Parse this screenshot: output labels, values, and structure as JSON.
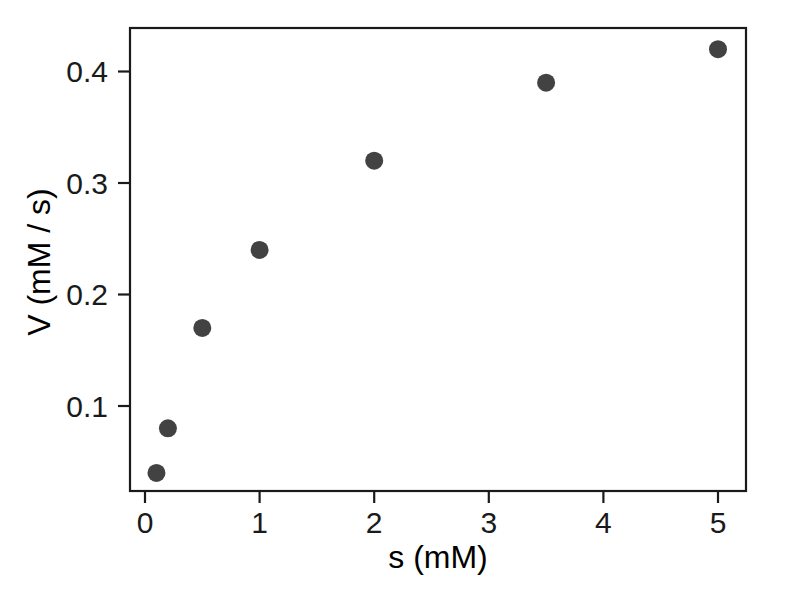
{
  "chart_data": {
    "type": "scatter",
    "title": "",
    "xlabel": "s (mM)",
    "ylabel": "V (mM / s)",
    "x": [
      0.1,
      0.2,
      0.5,
      1,
      2,
      3.5,
      5
    ],
    "values": [
      0.04,
      0.08,
      0.17,
      0.24,
      0.32,
      0.39,
      0.42
    ],
    "series": [
      {
        "name": "V",
        "x": [
          0.1,
          0.2,
          0.5,
          1,
          2,
          3.5,
          5
        ],
        "values": [
          0.04,
          0.08,
          0.17,
          0.24,
          0.32,
          0.39,
          0.42
        ]
      }
    ],
    "xlim": [
      -0.13,
      5.25
    ],
    "ylim": [
      0.0025,
      0.4175
    ],
    "xticks": [
      0,
      1,
      2,
      3,
      4,
      5
    ],
    "xticklabels": [
      "0",
      "1",
      "2",
      "3",
      "4",
      "5"
    ],
    "yticks": [
      0.1,
      0.2,
      0.3,
      0.4
    ],
    "yticklabels": [
      "0.1",
      "0.2",
      "0.3",
      "0.4"
    ],
    "grid": false,
    "legend": false,
    "marker": "filled-circle",
    "marker_color": "#424242",
    "marker_size": 18,
    "axis_color": "#1a1a1a",
    "background_color": "#ffffff"
  },
  "axes": {
    "x_title": "s (mM)",
    "y_title": "V (mM / s)",
    "x_tick_labels": [
      "0",
      "1",
      "2",
      "3",
      "4",
      "5"
    ],
    "y_tick_labels": [
      "0.1",
      "0.2",
      "0.3",
      "0.4"
    ]
  }
}
